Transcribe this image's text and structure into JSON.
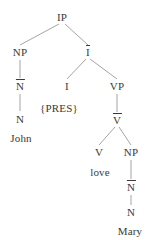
{
  "diagram": {
    "type": "x-bar-syntax-tree",
    "sentence": "John PRES love Mary",
    "text_color": "#3a3a3a",
    "line_color": "#9a9a9a",
    "background": "#ffffff",
    "nodes": [
      {
        "id": "ip",
        "label": "IP",
        "bar": false,
        "x": 62,
        "y": 17,
        "kind": "phrase"
      },
      {
        "id": "np1",
        "label": "NP",
        "bar": false,
        "x": 20,
        "y": 52,
        "kind": "phrase"
      },
      {
        "id": "ibar",
        "label": "I",
        "bar": true,
        "x": 88,
        "y": 52,
        "kind": "bar"
      },
      {
        "id": "nbar1",
        "label": "N",
        "bar": true,
        "x": 20,
        "y": 86,
        "kind": "bar"
      },
      {
        "id": "i",
        "label": "I",
        "bar": false,
        "x": 67,
        "y": 86,
        "kind": "head"
      },
      {
        "id": "vp",
        "label": "VP",
        "bar": false,
        "x": 117,
        "y": 86,
        "kind": "phrase"
      },
      {
        "id": "n1",
        "label": "N",
        "bar": false,
        "x": 20,
        "y": 119,
        "kind": "head"
      },
      {
        "id": "pres",
        "label": "{PRES}",
        "bar": false,
        "x": 59,
        "y": 108,
        "kind": "feature"
      },
      {
        "id": "vbar",
        "label": "V",
        "bar": true,
        "x": 117,
        "y": 120,
        "kind": "bar"
      },
      {
        "id": "john",
        "label": "John",
        "bar": false,
        "x": 21,
        "y": 138,
        "kind": "terminal"
      },
      {
        "id": "v",
        "label": "V",
        "bar": false,
        "x": 99,
        "y": 152,
        "kind": "head"
      },
      {
        "id": "np2",
        "label": "NP",
        "bar": false,
        "x": 131,
        "y": 152,
        "kind": "phrase"
      },
      {
        "id": "love",
        "label": "love",
        "bar": false,
        "x": 100,
        "y": 172,
        "kind": "terminal"
      },
      {
        "id": "nbar2",
        "label": "N",
        "bar": true,
        "x": 131,
        "y": 187,
        "kind": "bar"
      },
      {
        "id": "n2",
        "label": "N",
        "bar": false,
        "x": 131,
        "y": 212,
        "kind": "head"
      },
      {
        "id": "mary",
        "label": "Mary",
        "bar": false,
        "x": 130,
        "y": 231,
        "kind": "terminal"
      }
    ],
    "branches": [
      {
        "id": "ip-np1",
        "from": "ip",
        "to": "np1",
        "x1": 59,
        "y1": 24,
        "x2": 20,
        "y2": 45
      },
      {
        "id": "ip-ibar",
        "from": "ip",
        "to": "ibar",
        "x1": 65,
        "y1": 24,
        "x2": 88,
        "y2": 45
      },
      {
        "id": "np1-nbar1",
        "from": "np1",
        "to": "nbar1",
        "x1": 20,
        "y1": 60,
        "x2": 20,
        "y2": 78
      },
      {
        "id": "ibar-i",
        "from": "ibar",
        "to": "i",
        "x1": 86,
        "y1": 59,
        "x2": 67,
        "y2": 79
      },
      {
        "id": "ibar-vp",
        "from": "ibar",
        "to": "vp",
        "x1": 90,
        "y1": 59,
        "x2": 117,
        "y2": 79
      },
      {
        "id": "nbar1-n1",
        "from": "nbar1",
        "to": "n1",
        "x1": 20,
        "y1": 94,
        "x2": 20,
        "y2": 111
      },
      {
        "id": "vp-vbar",
        "from": "vp",
        "to": "vbar",
        "x1": 117,
        "y1": 94,
        "x2": 117,
        "y2": 112
      },
      {
        "id": "vbar-v",
        "from": "vbar",
        "to": "v",
        "x1": 115,
        "y1": 127,
        "x2": 99,
        "y2": 145
      },
      {
        "id": "vbar-np2",
        "from": "vbar",
        "to": "np2",
        "x1": 119,
        "y1": 127,
        "x2": 131,
        "y2": 145
      },
      {
        "id": "np2-nbar2",
        "from": "np2",
        "to": "nbar2",
        "x1": 131,
        "y1": 160,
        "x2": 131,
        "y2": 179
      },
      {
        "id": "nbar2-n2",
        "from": "nbar2",
        "to": "n2",
        "x1": 131,
        "y1": 195,
        "x2": 131,
        "y2": 205
      }
    ]
  }
}
